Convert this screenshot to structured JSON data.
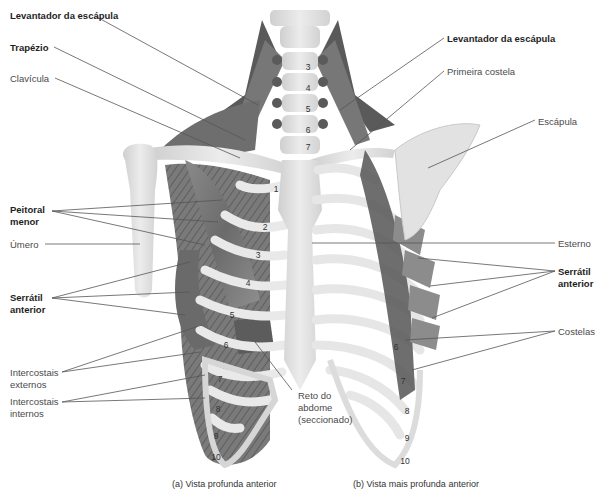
{
  "figure": {
    "left_labels": [
      {
        "id": "levantador-left",
        "text": "Levantador da escápula",
        "bold": true,
        "x": 10,
        "y": 10
      },
      {
        "id": "trapezio",
        "text": "Trapézio",
        "bold": true,
        "x": 10,
        "y": 42
      },
      {
        "id": "clavicula",
        "text": "Clavícula",
        "bold": false,
        "x": 10,
        "y": 73
      },
      {
        "id": "peitoral-menor",
        "text": "Peitoral\nmenor",
        "bold": true,
        "x": 10,
        "y": 204
      },
      {
        "id": "umero",
        "text": "Úmero",
        "bold": false,
        "x": 10,
        "y": 239
      },
      {
        "id": "serratil-left",
        "text": "Serrátil\nanterior",
        "bold": true,
        "x": 10,
        "y": 292
      },
      {
        "id": "intercostais-externos",
        "text": "Intercostais\nexternos",
        "bold": false,
        "x": 10,
        "y": 367
      },
      {
        "id": "intercostais-internos",
        "text": "Intercostais\ninternos",
        "bold": false,
        "x": 10,
        "y": 396
      }
    ],
    "right_labels": [
      {
        "id": "levantador-right",
        "text": "Levantador da escápula",
        "bold": true,
        "x": 447,
        "y": 33
      },
      {
        "id": "primeira-costela",
        "text": "Primeira costela",
        "bold": false,
        "x": 447,
        "y": 66
      },
      {
        "id": "escapula",
        "text": "Escápula",
        "bold": false,
        "x": 538,
        "y": 116
      },
      {
        "id": "esterno",
        "text": "Esterno",
        "bold": false,
        "x": 558,
        "y": 238
      },
      {
        "id": "serratil-right",
        "text": "Serrátil\nanterior",
        "bold": true,
        "x": 558,
        "y": 266
      },
      {
        "id": "costelas",
        "text": "Costelas",
        "bold": false,
        "x": 558,
        "y": 326
      }
    ],
    "center_labels": [
      {
        "id": "reto-abdome",
        "text": "Reto do\nabdome\n(seccionado)",
        "bold": false,
        "x": 298,
        "y": 393
      }
    ],
    "vertebra_numbers": [
      "3",
      "4",
      "5",
      "6",
      "7"
    ],
    "rib_numbers_left": [
      "1",
      "2",
      "3",
      "4",
      "5",
      "6",
      "7",
      "8",
      "9",
      "10"
    ],
    "rib_numbers_right": [
      "6",
      "7",
      "8",
      "9",
      "10"
    ],
    "captions": {
      "left": "(a) Vista profunda anterior",
      "right": "(b) Vista mais profunda anterior"
    }
  }
}
